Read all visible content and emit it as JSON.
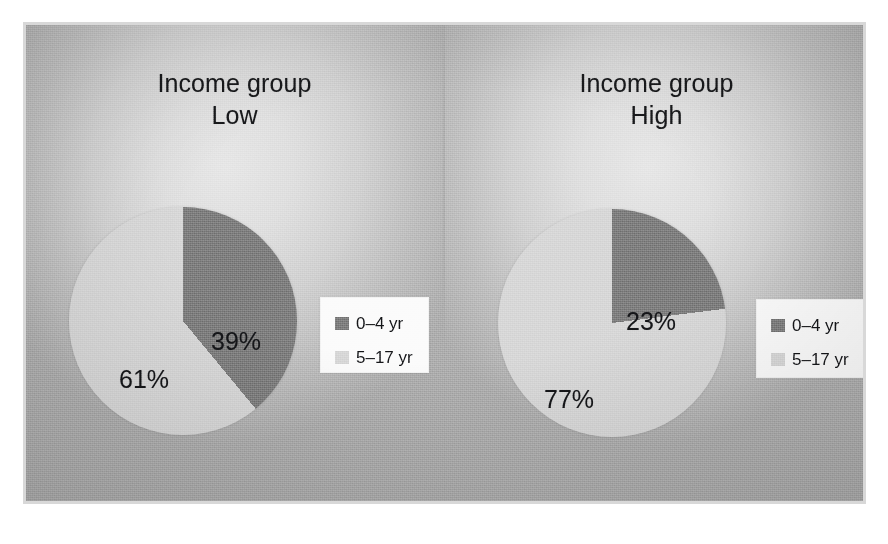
{
  "figure": {
    "background_color": "#c2c2c2",
    "frame_color": "#d8d8d8",
    "divider_color": "#a8a8a8"
  },
  "panels": [
    {
      "id": "low",
      "title": "Income group\nLow",
      "title_line1": "Income group",
      "title_line2": "Low",
      "labels": [
        "39%",
        "61%"
      ]
    },
    {
      "id": "high",
      "title": "Income group\nHigh",
      "title_line1": "Income group",
      "title_line2": "High",
      "labels": [
        "23%",
        "77%"
      ]
    }
  ],
  "legend": {
    "items": [
      {
        "label": "0–4 yr",
        "color": "#7b7b7b"
      },
      {
        "label": "5–17 yr",
        "color": "#d6d6d6"
      }
    ]
  },
  "chart_data": {
    "type": "pie",
    "title": "Income group",
    "subtitle": "",
    "xlabel": "",
    "ylabel": "",
    "legend_position": "right-inside",
    "grid": false,
    "series_labels": [
      "0–4 yr",
      "5–17 yr"
    ],
    "colors": [
      "#7b7b7b",
      "#d6d6d6"
    ],
    "charts": [
      {
        "title": "Income group Low",
        "group": "Low",
        "categories": [
          "0–4 yr",
          "5–17 yr"
        ],
        "values": [
          39,
          77
        ],
        "slices": [
          {
            "label": "0–4 yr",
            "value": 39,
            "display": "39%",
            "color": "#7b7b7b"
          },
          {
            "label": "5–17 yr",
            "value": 61,
            "display": "61%",
            "color": "#d6d6d6"
          }
        ]
      },
      {
        "title": "Income group High",
        "group": "High",
        "categories": [
          "0–4 yr",
          "5–17 yr"
        ],
        "values": [
          23,
          77
        ],
        "slices": [
          {
            "label": "0–4 yr",
            "value": 23,
            "display": "23%",
            "color": "#7b7b7b"
          },
          {
            "label": "5–17 yr",
            "value": 77,
            "display": "77%",
            "color": "#d6d6d6"
          }
        ]
      }
    ]
  }
}
